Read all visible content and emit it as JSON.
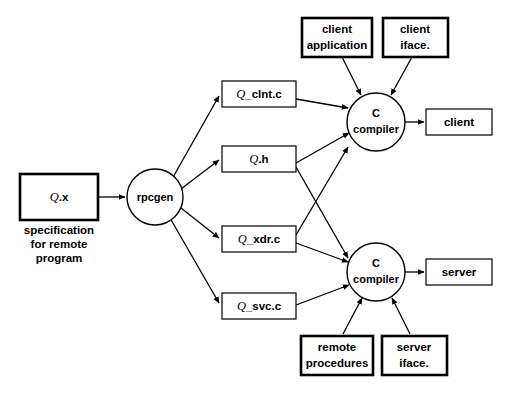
{
  "diagram": {
    "background_color": "#ffffff",
    "stroke_color": "#000000",
    "nodes": {
      "spec_file": {
        "q_prefix": "Q",
        "label": ".x",
        "shape": "box",
        "border": "thick"
      },
      "spec_caption": {
        "line1": "specification",
        "line2": "for remote",
        "line3": "program"
      },
      "rpcgen": {
        "label": "rpcgen",
        "shape": "circle"
      },
      "clnt_c": {
        "q_prefix": "Q",
        "label": "_clnt.c",
        "shape": "box",
        "border": "thin"
      },
      "q_h": {
        "q_prefix": "Q",
        "label": ".h",
        "shape": "box",
        "border": "thin"
      },
      "xdr_c": {
        "q_prefix": "Q",
        "label": "_xdr.c",
        "shape": "box",
        "border": "thin"
      },
      "svc_c": {
        "q_prefix": "Q",
        "label": "_svc.c",
        "shape": "box",
        "border": "thin"
      },
      "client_application": {
        "line1": "client",
        "line2": "application",
        "shape": "box",
        "border": "thick"
      },
      "client_iface": {
        "line1": "client",
        "line2": "iface.",
        "shape": "box",
        "border": "thick"
      },
      "remote_procedures": {
        "line1": "remote",
        "line2": "procedures",
        "shape": "box",
        "border": "thick"
      },
      "server_iface": {
        "line1": "server",
        "line2": "iface.",
        "shape": "box",
        "border": "thick"
      },
      "c_compiler_client": {
        "line1": "C",
        "line2": "compiler",
        "shape": "circle"
      },
      "c_compiler_server": {
        "line1": "C",
        "line2": "compiler",
        "shape": "circle"
      },
      "client_output": {
        "label": "client",
        "shape": "box",
        "border": "thin"
      },
      "server_output": {
        "label": "server",
        "shape": "box",
        "border": "thin"
      }
    },
    "edges": [
      {
        "from": "spec_file",
        "to": "rpcgen"
      },
      {
        "from": "rpcgen",
        "to": "clnt_c"
      },
      {
        "from": "rpcgen",
        "to": "q_h"
      },
      {
        "from": "rpcgen",
        "to": "xdr_c"
      },
      {
        "from": "rpcgen",
        "to": "svc_c"
      },
      {
        "from": "clnt_c",
        "to": "c_compiler_client"
      },
      {
        "from": "q_h",
        "to": "c_compiler_client"
      },
      {
        "from": "q_h",
        "to": "c_compiler_server"
      },
      {
        "from": "xdr_c",
        "to": "c_compiler_client"
      },
      {
        "from": "xdr_c",
        "to": "c_compiler_server"
      },
      {
        "from": "svc_c",
        "to": "c_compiler_server"
      },
      {
        "from": "client_application",
        "to": "c_compiler_client"
      },
      {
        "from": "client_iface",
        "to": "c_compiler_client"
      },
      {
        "from": "remote_procedures",
        "to": "c_compiler_server"
      },
      {
        "from": "server_iface",
        "to": "c_compiler_server"
      },
      {
        "from": "c_compiler_client",
        "to": "client_output"
      },
      {
        "from": "c_compiler_server",
        "to": "server_output"
      }
    ]
  }
}
